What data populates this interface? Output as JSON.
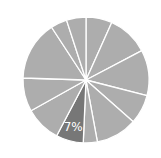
{
  "chart_data": {
    "type": "pie",
    "title": "",
    "start_angle_deg": 0,
    "direction": "clockwise",
    "categories": [
      "s1",
      "s2",
      "s3",
      "s4",
      "s5",
      "s6",
      "s7",
      "s8",
      "s9",
      "s10",
      "s11",
      "s12"
    ],
    "values": [
      6.7,
      10.6,
      11.7,
      7.5,
      10.6,
      3.6,
      7,
      9.2,
      8.6,
      15.3,
      4.2,
      5.0
    ],
    "highlight_index": 6,
    "labels": [
      {
        "index": 6,
        "text": "7%"
      }
    ],
    "legend": "none"
  },
  "style": {
    "slice_color": "#adadad",
    "highlight_color": "#777777",
    "separator_color": "#ffffff",
    "label_color": "#ffffff",
    "center": [
      86,
      80
    ],
    "radius": 63
  }
}
